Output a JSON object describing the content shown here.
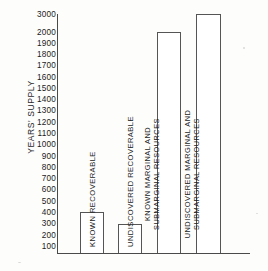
{
  "chart_data": {
    "type": "bar",
    "title": "",
    "xlabel": "",
    "ylabel": "YEARS' SUPPLY",
    "categories": [
      "KNOWN RECOVERABLE",
      "UNDISCOVERED RECOVERABLE",
      "KNOWN MARGINAL AND SUBMARGINAL RESOURCES",
      "UNDISCOVERED MARGINAL AND SUBMARGINAL RESOURCES"
    ],
    "values": [
      400,
      300,
      2000,
      3000
    ],
    "ylim": [
      0,
      3000
    ],
    "axis_break": true,
    "axis_break_note": "scale breaks between 2000 and 3000",
    "grid": false,
    "legend": "none",
    "ytick_labels": [
      "3000",
      "2000",
      "1900",
      "1800",
      "1700",
      "1600",
      "1500",
      "1400",
      "1300",
      "1200",
      "1100",
      "1000",
      "900",
      "800",
      "700",
      "600",
      "500",
      "400",
      "300",
      "200",
      "100"
    ],
    "ytick_values": [
      3000,
      2000,
      1900,
      1800,
      1700,
      1600,
      1500,
      1400,
      1300,
      1200,
      1100,
      1000,
      900,
      800,
      700,
      600,
      500,
      400,
      300,
      200,
      100
    ],
    "bar_fill_color": "#ffffff",
    "bar_edge_color": "#555555",
    "axis_color": "#4a4a4a",
    "background_color": "#fdfdfc"
  }
}
